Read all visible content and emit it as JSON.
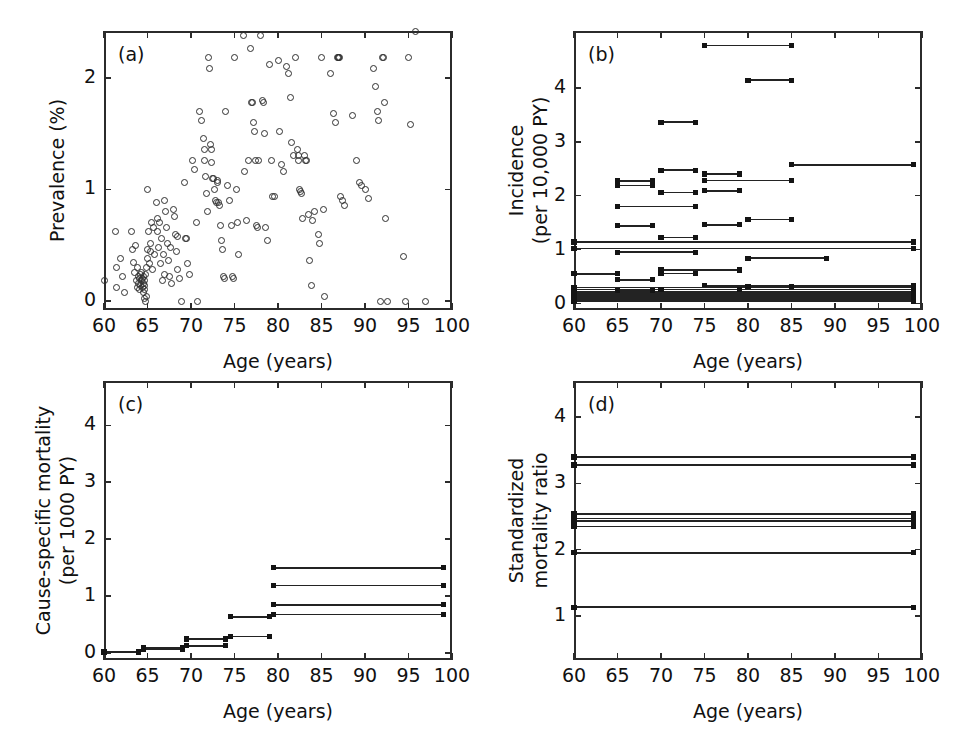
{
  "figure": {
    "partial_top_text": "",
    "panels": [
      "(a)",
      "(b)",
      "(c)",
      "(d)"
    ],
    "shared_xlabel": "Age (years)",
    "xticklabels": [
      "60",
      "65",
      "70",
      "75",
      "80",
      "85",
      "90",
      "95",
      "100"
    ]
  },
  "chart_data": [
    {
      "panel": "(a)",
      "type": "scatter",
      "title": "",
      "xlabel": "Age (years)",
      "ylabel": "Prevalence (%)",
      "xlim": [
        60,
        100
      ],
      "ylim": [
        -0.08,
        2.42
      ],
      "xticks": [
        60,
        65,
        70,
        75,
        80,
        85,
        90,
        95,
        100
      ],
      "yticks": [
        0,
        1,
        2
      ],
      "grid": false,
      "marker": "open-circle",
      "points": [
        [
          60.0,
          0.18
        ],
        [
          61.3,
          0.62
        ],
        [
          61.4,
          0.3
        ],
        [
          61.4,
          0.12
        ],
        [
          61.9,
          0.38
        ],
        [
          62.1,
          0.22
        ],
        [
          62.3,
          0.08
        ],
        [
          63.2,
          0.62
        ],
        [
          63.3,
          0.46
        ],
        [
          63.4,
          0.35
        ],
        [
          63.5,
          0.26
        ],
        [
          63.6,
          0.5
        ],
        [
          63.7,
          0.18
        ],
        [
          63.8,
          0.3
        ],
        [
          63.9,
          0.12
        ],
        [
          64.0,
          0.22
        ],
        [
          64.0,
          0.16
        ],
        [
          64.1,
          0.2
        ],
        [
          64.1,
          0.1
        ],
        [
          64.2,
          0.24
        ],
        [
          64.2,
          0.14
        ],
        [
          64.3,
          0.18
        ],
        [
          64.3,
          0.26
        ],
        [
          64.4,
          0.12
        ],
        [
          64.4,
          0.2
        ],
        [
          64.5,
          0.08
        ],
        [
          64.5,
          0.16
        ],
        [
          64.5,
          0.22
        ],
        [
          64.6,
          0.14
        ],
        [
          64.6,
          0.02
        ],
        [
          64.7,
          0.18
        ],
        [
          64.7,
          0.1
        ],
        [
          64.8,
          0.0
        ],
        [
          64.8,
          0.24
        ],
        [
          64.9,
          0.04
        ],
        [
          64.9,
          0.3
        ],
        [
          65.0,
          1.0
        ],
        [
          65.0,
          0.38
        ],
        [
          65.0,
          0.46
        ],
        [
          65.1,
          0.62
        ],
        [
          65.2,
          0.34
        ],
        [
          65.3,
          0.52
        ],
        [
          65.4,
          0.44
        ],
        [
          65.5,
          0.7
        ],
        [
          65.6,
          0.28
        ],
        [
          65.7,
          0.66
        ],
        [
          65.8,
          0.42
        ],
        [
          66.0,
          0.88
        ],
        [
          66.1,
          0.74
        ],
        [
          66.2,
          0.62
        ],
        [
          66.3,
          0.48
        ],
        [
          66.4,
          0.7
        ],
        [
          66.5,
          0.34
        ],
        [
          66.6,
          0.56
        ],
        [
          66.7,
          0.18
        ],
        [
          66.8,
          0.42
        ],
        [
          66.9,
          0.24
        ],
        [
          67.0,
          0.9
        ],
        [
          67.1,
          0.8
        ],
        [
          67.2,
          0.66
        ],
        [
          67.3,
          0.52
        ],
        [
          67.4,
          0.36
        ],
        [
          67.5,
          0.22
        ],
        [
          67.6,
          0.48
        ],
        [
          67.8,
          0.16
        ],
        [
          68.0,
          0.82
        ],
        [
          68.1,
          0.76
        ],
        [
          68.2,
          0.6
        ],
        [
          68.3,
          0.44
        ],
        [
          68.4,
          0.28
        ],
        [
          68.5,
          0.58
        ],
        [
          68.7,
          0.2
        ],
        [
          68.9,
          0.0
        ],
        [
          69.2,
          1.06
        ],
        [
          69.4,
          0.56
        ],
        [
          69.5,
          0.56
        ],
        [
          69.6,
          0.34
        ],
        [
          69.8,
          0.24
        ],
        [
          70.2,
          1.26
        ],
        [
          70.4,
          1.18
        ],
        [
          70.6,
          0.7
        ],
        [
          70.8,
          0.0
        ],
        [
          71.0,
          1.7
        ],
        [
          71.2,
          1.62
        ],
        [
          71.4,
          1.46
        ],
        [
          71.5,
          1.36
        ],
        [
          71.6,
          1.26
        ],
        [
          71.7,
          1.12
        ],
        [
          71.8,
          0.96
        ],
        [
          71.9,
          0.8
        ],
        [
          72.0,
          2.18
        ],
        [
          72.1,
          2.08
        ],
        [
          72.2,
          1.4
        ],
        [
          72.3,
          1.36
        ],
        [
          72.4,
          1.24
        ],
        [
          72.5,
          1.1
        ],
        [
          72.6,
          1.1
        ],
        [
          72.7,
          1.0
        ],
        [
          72.8,
          0.9
        ],
        [
          72.9,
          0.88
        ],
        [
          73.0,
          1.08
        ],
        [
          73.1,
          1.06
        ],
        [
          73.2,
          0.88
        ],
        [
          73.3,
          0.86
        ],
        [
          73.4,
          0.68
        ],
        [
          73.5,
          0.54
        ],
        [
          73.6,
          0.46
        ],
        [
          73.7,
          0.22
        ],
        [
          73.8,
          0.2
        ],
        [
          74.0,
          1.7
        ],
        [
          74.2,
          1.04
        ],
        [
          74.4,
          0.9
        ],
        [
          74.6,
          0.68
        ],
        [
          74.8,
          0.22
        ],
        [
          74.9,
          0.2
        ],
        [
          75.0,
          2.18
        ],
        [
          75.2,
          1.0
        ],
        [
          75.3,
          0.7
        ],
        [
          75.5,
          0.42
        ],
        [
          76.0,
          2.38
        ],
        [
          76.2,
          1.16
        ],
        [
          76.4,
          0.72
        ],
        [
          76.6,
          1.26
        ],
        [
          76.8,
          2.26
        ],
        [
          77.0,
          1.78
        ],
        [
          77.1,
          1.78
        ],
        [
          77.2,
          1.6
        ],
        [
          77.3,
          1.52
        ],
        [
          77.4,
          1.26
        ],
        [
          77.5,
          0.68
        ],
        [
          77.6,
          0.66
        ],
        [
          77.8,
          1.26
        ],
        [
          78.0,
          2.38
        ],
        [
          78.2,
          1.8
        ],
        [
          78.3,
          1.78
        ],
        [
          78.4,
          1.5
        ],
        [
          78.6,
          0.66
        ],
        [
          78.8,
          0.54
        ],
        [
          79.0,
          2.12
        ],
        [
          79.2,
          1.26
        ],
        [
          79.4,
          0.94
        ],
        [
          79.6,
          0.94
        ],
        [
          80.0,
          2.16
        ],
        [
          80.2,
          1.52
        ],
        [
          80.4,
          1.22
        ],
        [
          80.6,
          1.16
        ],
        [
          81.0,
          2.1
        ],
        [
          81.2,
          2.04
        ],
        [
          81.4,
          1.82
        ],
        [
          81.6,
          1.42
        ],
        [
          81.8,
          1.3
        ],
        [
          82.0,
          2.18
        ],
        [
          82.2,
          1.36
        ],
        [
          82.3,
          1.3
        ],
        [
          82.4,
          1.26
        ],
        [
          82.5,
          1.0
        ],
        [
          82.6,
          0.98
        ],
        [
          82.7,
          0.96
        ],
        [
          82.8,
          0.74
        ],
        [
          83.0,
          1.3
        ],
        [
          83.2,
          1.26
        ],
        [
          83.3,
          1.26
        ],
        [
          83.5,
          0.78
        ],
        [
          83.6,
          0.36
        ],
        [
          83.8,
          0.14
        ],
        [
          84.0,
          0.72
        ],
        [
          84.2,
          0.8
        ],
        [
          84.6,
          0.6
        ],
        [
          84.8,
          0.52
        ],
        [
          85.0,
          2.18
        ],
        [
          85.2,
          0.82
        ],
        [
          85.4,
          0.04
        ],
        [
          86.0,
          2.04
        ],
        [
          86.4,
          1.68
        ],
        [
          86.6,
          1.6
        ],
        [
          86.8,
          2.18
        ],
        [
          86.9,
          2.18
        ],
        [
          87.0,
          2.18
        ],
        [
          87.1,
          2.18
        ],
        [
          87.2,
          0.94
        ],
        [
          87.4,
          0.9
        ],
        [
          87.6,
          0.86
        ],
        [
          88.6,
          1.66
        ],
        [
          89.0,
          1.26
        ],
        [
          89.4,
          1.06
        ],
        [
          89.6,
          1.04
        ],
        [
          90.0,
          1.0
        ],
        [
          90.4,
          0.92
        ],
        [
          91.0,
          2.08
        ],
        [
          91.2,
          1.92
        ],
        [
          91.4,
          1.7
        ],
        [
          91.6,
          1.62
        ],
        [
          91.8,
          0.0
        ],
        [
          92.0,
          2.18
        ],
        [
          92.1,
          2.18
        ],
        [
          92.2,
          1.78
        ],
        [
          92.4,
          0.74
        ],
        [
          92.6,
          0.0
        ],
        [
          94.4,
          0.4
        ],
        [
          94.6,
          0.0
        ],
        [
          95.0,
          2.18
        ],
        [
          95.2,
          1.58
        ],
        [
          95.8,
          2.42
        ],
        [
          97.0,
          0.0
        ]
      ]
    },
    {
      "panel": "(b)",
      "type": "line",
      "title": "",
      "xlabel": "Age (years)",
      "ylabel": "Incidence\n(per 10,000 PY)",
      "ylabel_line1": "Incidence",
      "ylabel_line2": "(per 10,000 PY)",
      "xlim": [
        60,
        100
      ],
      "ylim": [
        -0.12,
        5.05
      ],
      "xticks": [
        60,
        65,
        70,
        75,
        80,
        85,
        90,
        95,
        100
      ],
      "yticks": [
        0,
        1,
        2,
        3,
        4
      ],
      "grid": false,
      "marker": "filled-square",
      "segments": [
        [
          75.0,
          85.0,
          4.78
        ],
        [
          80.0,
          85.0,
          4.14
        ],
        [
          70.0,
          74.0,
          3.36
        ],
        [
          85.0,
          99.0,
          2.57
        ],
        [
          70.0,
          74.0,
          2.47
        ],
        [
          75.0,
          79.0,
          2.4
        ],
        [
          65.0,
          69.0,
          2.27
        ],
        [
          65.0,
          69.0,
          2.19
        ],
        [
          75.0,
          85.0,
          2.28
        ],
        [
          70.0,
          74.0,
          2.06
        ],
        [
          75.0,
          79.0,
          2.09
        ],
        [
          65.0,
          74.0,
          1.8
        ],
        [
          80.0,
          85.0,
          1.56
        ],
        [
          65.0,
          69.0,
          1.44
        ],
        [
          75.0,
          79.0,
          1.46
        ],
        [
          70.0,
          74.0,
          1.22
        ],
        [
          60.0,
          99.0,
          1.14
        ],
        [
          60.0,
          99.0,
          1.02
        ],
        [
          65.0,
          74.0,
          0.95
        ],
        [
          80.0,
          89.0,
          0.84
        ],
        [
          60.0,
          65.0,
          0.55
        ],
        [
          70.0,
          79.0,
          0.62
        ],
        [
          70.0,
          74.0,
          0.56
        ],
        [
          65.0,
          69.0,
          0.44
        ],
        [
          75.0,
          99.0,
          0.33
        ],
        [
          60.0,
          99.0,
          0.3
        ],
        [
          60.0,
          99.0,
          0.26
        ],
        [
          60.0,
          99.0,
          0.22
        ],
        [
          60.0,
          99.0,
          0.19
        ],
        [
          60.0,
          99.0,
          0.16
        ],
        [
          60.0,
          99.0,
          0.13
        ],
        [
          60.0,
          99.0,
          0.1
        ],
        [
          60.0,
          99.0,
          0.07
        ],
        [
          60.0,
          99.0,
          0.04
        ],
        [
          65.0,
          69.0,
          0.24
        ],
        [
          70.0,
          79.0,
          0.26
        ],
        [
          80.0,
          85.0,
          0.31
        ]
      ]
    },
    {
      "panel": "(c)",
      "type": "line",
      "title": "",
      "xlabel": "Age (years)",
      "ylabel": "Cause-specific mortality\n(per 1000 PY)",
      "ylabel_line1": "Cause-specific mortality",
      "ylabel_line2": "(per 1000 PY)",
      "xlim": [
        60,
        100
      ],
      "ylim": [
        -0.12,
        4.78
      ],
      "xticks": [
        60,
        65,
        70,
        75,
        80,
        85,
        90,
        95,
        100
      ],
      "yticks": [
        0,
        1,
        2,
        3,
        4
      ],
      "grid": false,
      "marker": "filled-square",
      "segments": [
        [
          60.0,
          64.0,
          0.02
        ],
        [
          64.5,
          69.0,
          0.07
        ],
        [
          64.5,
          69.0,
          0.09
        ],
        [
          69.5,
          74.0,
          0.13
        ],
        [
          69.5,
          74.0,
          0.25
        ],
        [
          74.5,
          79.0,
          0.29
        ],
        [
          74.5,
          79.0,
          0.64
        ],
        [
          79.5,
          99.0,
          1.5
        ],
        [
          79.5,
          99.0,
          1.19
        ],
        [
          79.5,
          99.0,
          0.85
        ],
        [
          79.5,
          99.0,
          0.68
        ]
      ]
    },
    {
      "panel": "(d)",
      "type": "line",
      "title": "",
      "xlabel": "Age (years)",
      "ylabel": "Standardized\nmortality ratio",
      "ylabel_line1": "Standardized",
      "ylabel_line2": "mortality ratio",
      "xlim": [
        60,
        100
      ],
      "ylim": [
        0.33,
        4.55
      ],
      "xticks": [
        60,
        65,
        70,
        75,
        80,
        85,
        90,
        95,
        100
      ],
      "yticks": [
        1,
        2,
        3,
        4
      ],
      "grid": false,
      "marker": "filled-square",
      "segments": [
        [
          60.0,
          99.0,
          3.4
        ],
        [
          60.0,
          99.0,
          3.28
        ],
        [
          60.0,
          99.0,
          2.54
        ],
        [
          60.0,
          99.0,
          2.47
        ],
        [
          60.0,
          99.0,
          2.43
        ],
        [
          60.0,
          99.0,
          2.35
        ],
        [
          60.0,
          99.0,
          1.95
        ],
        [
          60.0,
          99.0,
          1.13
        ]
      ]
    }
  ]
}
